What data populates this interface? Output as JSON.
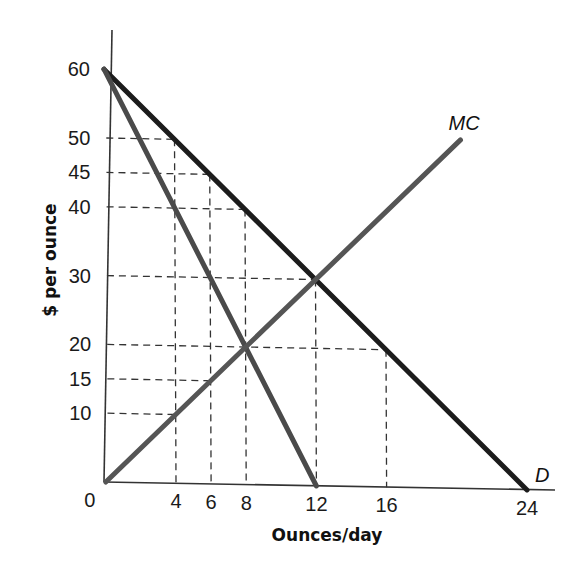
{
  "chart_data": {
    "type": "line",
    "title": "",
    "xlabel": "Ounces/day",
    "ylabel": "$ per ounce",
    "xlim": [
      0,
      25
    ],
    "ylim": [
      0,
      65
    ],
    "x_ticks": [
      0,
      4,
      6,
      8,
      12,
      16,
      24
    ],
    "y_ticks": [
      60,
      50,
      45,
      40,
      30,
      20,
      15,
      10
    ],
    "x_tick_labels": [
      "0",
      "4",
      "6",
      "8",
      "12",
      "16",
      "24"
    ],
    "y_tick_labels": [
      "60",
      "50",
      "45",
      "40",
      "30",
      "20",
      "15",
      "10"
    ],
    "grid": false,
    "series": [
      {
        "name": "D",
        "label": "D",
        "points": [
          [
            0,
            60
          ],
          [
            24,
            0
          ]
        ],
        "color": "#1c1c1c"
      },
      {
        "name": "MR",
        "label": "",
        "points": [
          [
            0,
            60
          ],
          [
            12,
            0
          ]
        ],
        "color": "#4a4a4a"
      },
      {
        "name": "MC",
        "label": "MC",
        "points": [
          [
            0,
            0
          ],
          [
            20.3,
            50.7
          ]
        ],
        "color": "#555555"
      }
    ],
    "dashed_guides": {
      "horizontal": [
        {
          "y": 50,
          "x_end": 4
        },
        {
          "y": 45,
          "x_end": 6
        },
        {
          "y": 40,
          "x_end": 8
        },
        {
          "y": 30,
          "x_end": 12
        },
        {
          "y": 20,
          "x_end": 16
        },
        {
          "y": 15,
          "x_end": 6
        },
        {
          "y": 10,
          "x_end": 4
        }
      ],
      "vertical": [
        {
          "x": 4,
          "y_top": 50
        },
        {
          "x": 6,
          "y_top": 45
        },
        {
          "x": 8,
          "y_top": 40
        },
        {
          "x": 12,
          "y_top": 30
        },
        {
          "x": 16,
          "y_top": 20
        }
      ]
    },
    "annotations": [
      {
        "text": "MC",
        "near": [
          20.3,
          50.7
        ]
      },
      {
        "text": "D",
        "near": [
          24,
          0
        ]
      }
    ]
  }
}
